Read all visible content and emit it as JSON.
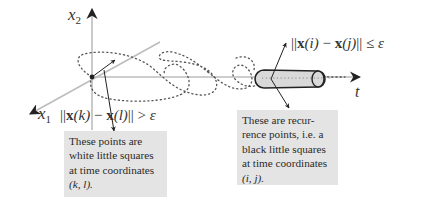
{
  "diagram": {
    "axes": {
      "vertical_label": "x",
      "vertical_sub": "2",
      "diagonal_label": "x",
      "diagonal_sub": "1",
      "horizontal_label": "t"
    },
    "conditions": {
      "non_recurrence": {
        "norm_open": "||",
        "x1": "x",
        "arg1": "(k)",
        "minus": " − ",
        "x2": "x",
        "arg2": "(l)",
        "norm_close": "||",
        "relation": " > ",
        "epsilon": "ε"
      },
      "recurrence": {
        "norm_open": "||",
        "x1": "x",
        "arg1": "(i)",
        "minus": " − ",
        "x2": "x",
        "arg2": "(j)",
        "norm_close": "||",
        "relation": " ≤ ",
        "epsilon": "ε"
      }
    },
    "notes": {
      "left": {
        "lines": [
          "These points are",
          "white little squares",
          "at time coordinates",
          "(k, l)."
        ]
      },
      "right": {
        "lines": [
          "These are recur-",
          "rence points, i.e. a",
          "black little squares",
          "at time coordinates",
          "(i, j)."
        ]
      }
    },
    "colors": {
      "axis_black": "#222222",
      "axis_gray": "#bdbdbd",
      "trajectory": "#555555",
      "tube_fill": "#d9d9d9",
      "note_bg": "#e4e4e4"
    }
  }
}
